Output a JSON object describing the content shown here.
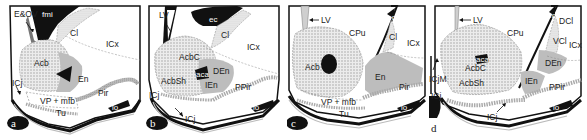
{
  "figure": {
    "type": "coronal brain section diagrams",
    "panels": [
      {
        "id": "a",
        "panel_label": "a",
        "labels": {
          "e_ov": "E&OV",
          "fmi": "fmi",
          "cl": "Cl",
          "icx": "ICx",
          "acb": "Acb",
          "en": "En",
          "icj": "ICj",
          "pir": "Pir",
          "lo": "lo",
          "vp_mfb": "VP + mfb",
          "tu": "Tu"
        }
      },
      {
        "id": "b",
        "panel_label": "b",
        "labels": {
          "lv": "LV",
          "ec": "ec",
          "cl": "Cl",
          "icx": "ICx",
          "acbc": "AcbC",
          "aca": "aca",
          "den": "DEn",
          "acbsh": "AcbSh",
          "ien": "IEn",
          "ppir": "PPir",
          "icj_left": "ICj",
          "icj_bottom": "ICj",
          "lo": "lo"
        }
      },
      {
        "id": "c",
        "panel_label": "c",
        "labels": {
          "lv": "LV",
          "cpu": "CPu",
          "ec": "ec",
          "cl": "Cl",
          "icx": "ICx",
          "acb": "Acb",
          "en": "En",
          "pir": "Pir",
          "lo": "lo",
          "vp_mfb": "VP + mfb",
          "tu": "Tu"
        }
      },
      {
        "id": "d",
        "panel_label": "d",
        "labels": {
          "lv": "LV",
          "cpu": "CPu",
          "ec": "ec",
          "dci": "DCl",
          "vci": "VCl",
          "icx": "ICx",
          "aca": "aca",
          "acbc": "AcbC",
          "icjm": "ICjM",
          "acbsh": "AcbSh",
          "den": "DEn",
          "ien": "IEn",
          "ppir": "PPir",
          "icj_left": "ICj",
          "icj_bottom": "ICj",
          "lo": "lo"
        }
      }
    ]
  },
  "colors": {
    "outline": "#111111",
    "stipple": "#bdbdbd",
    "gray_region": "#a9a9a9",
    "light_gray": "#d4d4d4",
    "black_fill": "#111111",
    "background": "#ffffff"
  }
}
